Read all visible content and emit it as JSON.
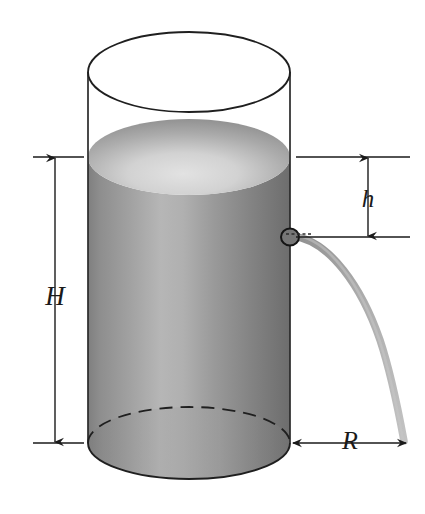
{
  "figure": {
    "type": "physics-diagram",
    "background_color": "#ffffff",
    "ink_color": "#1a1a1a"
  },
  "labels": {
    "height_total": "H",
    "height_to_hole": "h",
    "range": "R"
  },
  "dimensions": {
    "H": {
      "name": "H",
      "meaning": "height of liquid column above the base",
      "orientation": "vertical",
      "arrow_style": "double-headed",
      "side": "left",
      "top_y": 157,
      "bottom_y": 443,
      "axis_x": 55
    },
    "h": {
      "name": "h",
      "meaning": "depth of hole below the liquid surface",
      "orientation": "vertical",
      "arrow_style": "double-headed",
      "side": "right",
      "top_y": 157,
      "bottom_y": 237,
      "axis_x": 368
    },
    "R": {
      "name": "R",
      "meaning": "horizontal range of the emerging jet measured from the tank wall",
      "orientation": "horizontal",
      "arrow_style": "double-headed",
      "side": "bottom",
      "left_x": 292,
      "right_x": 406,
      "axis_y": 443
    }
  },
  "cylinder": {
    "name": "cylindrical-tank",
    "left_x": 88,
    "right_x": 290,
    "top_y": 40,
    "bottom_y": 443,
    "rim_ellipse_ry": 40,
    "base_ellipse_ry": 36,
    "wall_color": "#2a2a2a",
    "hidden_edge_style": "dashed"
  },
  "liquid": {
    "name": "liquid-fill",
    "surface_y": 157,
    "surface_ellipse_ry": 38,
    "body_fill_colors": [
      "#8d8d8d",
      "#b4b4b4",
      "#9a9a9a",
      "#6f6f6f"
    ],
    "surface_fill_colors": [
      "#8f8f8f",
      "#d8d8d8",
      "#cfcfcf"
    ]
  },
  "hole": {
    "name": "drain-hole",
    "center_x": 290,
    "center_y": 237,
    "radius": 8,
    "fill_color": "#6e6e6e",
    "stroke_color": "#1a1a1a"
  },
  "jet": {
    "name": "water-jet",
    "description": "parabolic stream of liquid leaving the hole and landing at the range distance R",
    "start": [
      292,
      236
    ],
    "end": [
      404,
      440
    ],
    "color": "#9b9b9b",
    "path_type": "parabola"
  }
}
